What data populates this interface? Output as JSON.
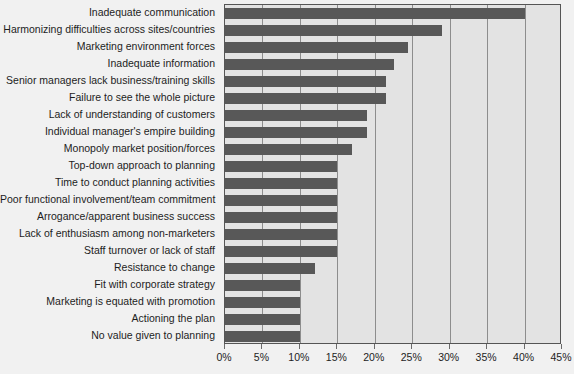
{
  "chart_data": {
    "type": "bar",
    "orientation": "horizontal",
    "title": "",
    "xlabel": "",
    "ylabel": "",
    "xlim": [
      0,
      45
    ],
    "xticks": [
      0,
      5,
      10,
      15,
      20,
      25,
      30,
      35,
      40,
      45
    ],
    "xtick_labels": [
      "0%",
      "5%",
      "10%",
      "15%",
      "20%",
      "25%",
      "30%",
      "35%",
      "40%",
      "45%"
    ],
    "grid": true,
    "legend": false,
    "bar_color": "#585858",
    "plot_background": "#e3e3e3",
    "page_background": "#f1f1f1",
    "categories": [
      "Inadequate communication",
      "Harmonizing difficulties across sites/countries",
      "Marketing environment forces",
      "Inadequate information",
      "Senior managers lack business/training skills",
      "Failure to see the whole picture",
      "Lack of understanding of customers",
      "Individual manager's empire building",
      "Monopoly market position/forces",
      "Top-down approach to planning",
      "Time to conduct planning activities",
      "Poor functional involvement/team commitment",
      "Arrogance/apparent business success",
      "Lack of enthusiasm among non-marketers",
      "Staff turnover or lack of staff",
      "Resistance to change",
      "Fit with corporate strategy",
      "Marketing is equated with promotion",
      "Actioning the plan",
      "No value given to planning"
    ],
    "values": [
      40,
      29,
      24.5,
      22.5,
      21.5,
      21.5,
      19,
      19,
      17,
      15,
      15,
      15,
      15,
      15,
      15,
      12,
      10,
      10,
      10,
      10
    ]
  }
}
